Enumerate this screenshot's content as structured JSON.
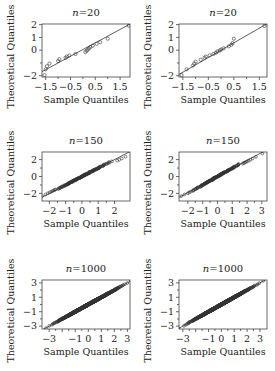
{
  "chart_data": [
    {
      "type": "scatter",
      "panel": "top-left",
      "title_prefix": "n",
      "title_value": "=20",
      "xlabel": "Sample Quantiles",
      "ylabel": "Theoretical Quantiles",
      "xlim": [
        -1.65,
        1.9
      ],
      "ylim": [
        -2.1,
        2.05
      ],
      "xticks": [
        -1.5,
        -0.5,
        0.5,
        1.5
      ],
      "xtick_labels": [
        "−1.5",
        "−0.5",
        "0.5",
        "1.5"
      ],
      "yticks": [
        2,
        1,
        0,
        -2
      ],
      "ytick_labels": [
        "2",
        "1",
        "0",
        "−2"
      ],
      "yminor_ticks": [
        -1
      ],
      "refline": {
        "slope": 1.05,
        "intercept": 0.05
      },
      "points": {
        "x": [
          -1.55,
          -1.5,
          -1.45,
          -1.35,
          -1.0,
          -0.95,
          -0.7,
          -0.65,
          -0.55,
          -0.3,
          0.1,
          0.15,
          0.2,
          0.25,
          0.3,
          0.4,
          0.55,
          0.7,
          1.0,
          1.85
        ],
        "y": [
          -1.95,
          -1.5,
          -1.25,
          -1.05,
          -0.85,
          -0.7,
          -0.6,
          -0.5,
          -0.42,
          -0.3,
          -0.15,
          -0.05,
          0.05,
          0.15,
          0.25,
          0.35,
          0.5,
          0.62,
          0.9,
          1.92
        ]
      }
    },
    {
      "type": "scatter",
      "panel": "top-right",
      "title_prefix": "n",
      "title_value": "=20",
      "xlabel": "Sample Quantiles",
      "ylabel": "Theoretical Quantiles",
      "xlim": [
        -1.65,
        1.8
      ],
      "ylim": [
        -2.1,
        2.05
      ],
      "xticks": [
        -1.5,
        -0.5,
        0.5,
        1.5
      ],
      "xtick_labels": [
        "−1.5",
        "−0.5",
        "0.5",
        "1.5"
      ],
      "yticks": [
        2,
        1,
        0,
        -2
      ],
      "ytick_labels": [
        "2",
        "1",
        "0",
        "−2"
      ],
      "yminor_ticks": [
        -1
      ],
      "refline": {
        "slope": 1.15,
        "intercept": 0.0
      },
      "points": {
        "x": [
          -1.55,
          -1.35,
          -1.1,
          -1.05,
          -1.0,
          -0.8,
          -0.65,
          -0.6,
          -0.45,
          -0.3,
          -0.2,
          -0.15,
          -0.05,
          0.0,
          0.1,
          0.3,
          0.4,
          0.45,
          0.5,
          1.7
        ],
        "y": [
          -1.95,
          -1.5,
          -1.2,
          -1.05,
          -0.9,
          -0.75,
          -0.6,
          -0.5,
          -0.4,
          -0.3,
          -0.2,
          -0.1,
          -0.02,
          0.05,
          0.15,
          0.3,
          0.42,
          0.55,
          0.9,
          1.9
        ]
      }
    },
    {
      "type": "scatter",
      "panel": "middle-left",
      "title_prefix": "n",
      "title_value": "=150",
      "xlabel": "Sample Quantiles",
      "ylabel": "Theoretical Quantiles",
      "xlim": [
        -2.45,
        2.95
      ],
      "ylim": [
        -2.9,
        2.9
      ],
      "xticks": [
        -2,
        -1,
        0,
        1,
        2
      ],
      "xtick_labels": [
        "−2",
        "−1",
        "0",
        "1",
        "2"
      ],
      "yticks": [
        2,
        0,
        -2
      ],
      "ytick_labels": [
        "2",
        "0",
        "−2"
      ],
      "yminor_ticks": [
        1,
        -1
      ],
      "refline": {
        "slope": 1.0,
        "intercept": 0.0
      },
      "n": 150,
      "distortion": "light-left"
    },
    {
      "type": "scatter",
      "panel": "middle-right",
      "title_prefix": "n",
      "title_value": "=150",
      "xlabel": "Sample Quantiles",
      "ylabel": "Theoretical Quantiles",
      "xlim": [
        -2.6,
        3.35
      ],
      "ylim": [
        -2.9,
        2.9
      ],
      "xticks": [
        -2,
        -1,
        0,
        1,
        2,
        3
      ],
      "xtick_labels": [
        "−2",
        "−1",
        "0",
        "1",
        "2",
        "3"
      ],
      "yticks": [
        2,
        0,
        -2
      ],
      "ytick_labels": [
        "2",
        "0",
        "−2"
      ],
      "yminor_ticks": [
        1,
        -1
      ],
      "refline": {
        "slope": 0.95,
        "intercept": 0.0
      },
      "n": 150,
      "distortion": "heavy-right"
    },
    {
      "type": "scatter",
      "panel": "bottom-left",
      "title_prefix": "n",
      "title_value": "=1000",
      "xlabel": "Sample Quantiles",
      "ylabel": "Theoretical Quantiles",
      "xlim": [
        -3.55,
        3.2
      ],
      "ylim": [
        -3.4,
        3.4
      ],
      "xticks": [
        -3,
        -2,
        -1,
        0,
        1,
        2,
        3
      ],
      "xtick_labels": [
        "−3",
        "",
        "−1",
        "0",
        "1",
        "2",
        "3"
      ],
      "yticks": [
        3,
        1,
        -1,
        -3
      ],
      "ytick_labels": [
        "3",
        "1",
        "−1",
        "−3"
      ],
      "yminor_ticks": [
        2,
        0,
        -2
      ],
      "refline": {
        "slope": 1.0,
        "intercept": 0.0
      },
      "n": 1000,
      "distortion": "none"
    },
    {
      "type": "scatter",
      "panel": "bottom-right",
      "title_prefix": "n",
      "title_value": "=1000",
      "xlabel": "Sample Quantiles",
      "ylabel": "Theoretical Quantiles",
      "xlim": [
        -3.3,
        3.55
      ],
      "ylim": [
        -3.4,
        3.4
      ],
      "xticks": [
        -3,
        -2,
        -1,
        0,
        1,
        2,
        3
      ],
      "xtick_labels": [
        "−3",
        "",
        "−1",
        "0",
        "1",
        "2",
        "3"
      ],
      "yticks": [
        3,
        1,
        -1,
        -3
      ],
      "ytick_labels": [
        "3",
        "1",
        "−1",
        "−3"
      ],
      "yminor_ticks": [
        2,
        0,
        -2
      ],
      "refline": {
        "slope": 1.0,
        "intercept": 0.0
      },
      "n": 1000,
      "distortion": "none"
    }
  ]
}
